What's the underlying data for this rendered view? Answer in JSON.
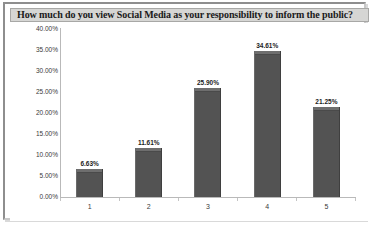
{
  "chart_data": {
    "type": "bar",
    "title": "How much do you view Social Media as your responsibility to inform the public?",
    "xlabel": "",
    "ylabel": "",
    "categories": [
      "1",
      "2",
      "3",
      "4",
      "5"
    ],
    "values": [
      6.63,
      11.61,
      25.9,
      34.61,
      21.25
    ],
    "value_labels": [
      "6.63%",
      "11.61%",
      "25.90%",
      "34.61%",
      "21.25%"
    ],
    "ylim": [
      0,
      40
    ],
    "ytick_values": [
      0,
      5,
      10,
      15,
      20,
      25,
      30,
      35,
      40
    ],
    "ytick_labels": [
      "0.00%",
      "5.00%",
      "10.00%",
      "15.00%",
      "20.00%",
      "25.00%",
      "30.00%",
      "35.00%",
      "40.00%"
    ],
    "grid": false,
    "legend": null,
    "series": [
      {
        "name": "Series 1",
        "values": [
          6.63,
          11.61,
          25.9,
          34.61,
          21.25
        ],
        "color": "#535353"
      }
    ],
    "colors": {
      "bar_fill": "#535353",
      "bar_highlight": "#6e6e6e",
      "plot_background": "#ffffff",
      "title_background": "#d6d6d4",
      "frame_border": "#8e8e8e",
      "axis_line": "#b9b9b9",
      "label_text": "#3a3a3a"
    }
  }
}
